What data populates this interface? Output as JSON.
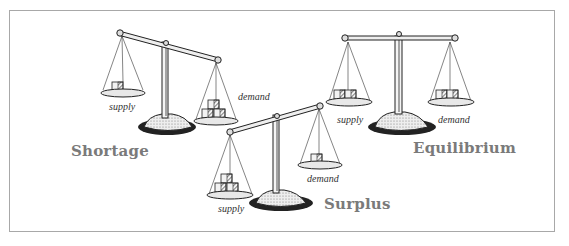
{
  "figure": {
    "frame_border_color": "#a8a8a8",
    "label_color": "#7a7a7a",
    "states": [
      {
        "name": "Shortage",
        "description": "Demand pan heavier than supply pan; beam tilts down toward demand",
        "supply_label": "supply",
        "demand_label": "demand",
        "supply_boxes": 1,
        "demand_boxes": 3
      },
      {
        "name": "Surplus",
        "description": "Supply pan heavier than demand pan; beam tilts down toward supply",
        "supply_label": "supply",
        "demand_label": "demand",
        "supply_boxes": 3,
        "demand_boxes": 1
      },
      {
        "name": "Equilibrium",
        "description": "Supply and demand pans equal; beam level",
        "supply_label": "supply",
        "demand_label": "demand",
        "supply_boxes": 2,
        "demand_boxes": 2
      }
    ]
  }
}
